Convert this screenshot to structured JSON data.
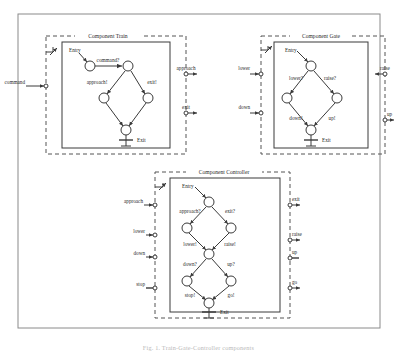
{
  "figure": {
    "caption": "Fig. 1.  Train-Gate-Controller components",
    "outer_border_color": "#7b7b7b",
    "dashed_color": "#555555",
    "solid_color": "#3a3a3a"
  },
  "components": [
    {
      "id": "train",
      "title": "Component Train",
      "entry_label": "Entry",
      "exit_label": "Exit",
      "transitions": [
        {
          "id": "t-command",
          "label": "command?"
        },
        {
          "id": "t-approach",
          "label": "approach!"
        },
        {
          "id": "t-exit",
          "label": "exit!"
        }
      ],
      "ports_left": [
        {
          "id": "p-command",
          "label": "command",
          "direction": "in"
        }
      ],
      "ports_right": [
        {
          "id": "p-approach",
          "label": "approach",
          "direction": "out"
        },
        {
          "id": "p-exit",
          "label": "exit",
          "direction": "out"
        }
      ]
    },
    {
      "id": "gate",
      "title": "Component Gate",
      "entry_label": "Entry",
      "exit_label": "Exit",
      "transitions": [
        {
          "id": "g-lower",
          "label": "lower?"
        },
        {
          "id": "g-raise",
          "label": "raise?"
        },
        {
          "id": "g-down",
          "label": "down!"
        },
        {
          "id": "g-up",
          "label": "up!"
        }
      ],
      "ports_left": [
        {
          "id": "p-lower",
          "label": "lower",
          "direction": "in"
        },
        {
          "id": "p-down",
          "label": "down",
          "direction": "in"
        }
      ],
      "ports_right": [
        {
          "id": "p-raise",
          "label": "raise",
          "direction": "out"
        },
        {
          "id": "p-up",
          "label": "up",
          "direction": "out"
        }
      ]
    },
    {
      "id": "controller",
      "title": "Component Controller",
      "entry_label": "Entry",
      "exit_label": "Exit",
      "transitions": [
        {
          "id": "c-approach",
          "label": "approach?"
        },
        {
          "id": "c-exit",
          "label": "exit?"
        },
        {
          "id": "c-lower",
          "label": "lower!"
        },
        {
          "id": "c-raise",
          "label": "raise!"
        },
        {
          "id": "c-down",
          "label": "down?"
        },
        {
          "id": "c-up",
          "label": "up?"
        },
        {
          "id": "c-stop",
          "label": "stop!"
        },
        {
          "id": "c-go",
          "label": "go!"
        }
      ],
      "ports_left": [
        {
          "id": "p-c-approach",
          "label": "approach",
          "direction": "in"
        },
        {
          "id": "p-c-lower",
          "label": "lower",
          "direction": "in"
        },
        {
          "id": "p-c-down",
          "label": "down",
          "direction": "in"
        },
        {
          "id": "p-c-stop",
          "label": "stop",
          "direction": "in"
        }
      ],
      "ports_right": [
        {
          "id": "p-c-exit",
          "label": "exit",
          "direction": "out"
        },
        {
          "id": "p-c-raise",
          "label": "raise",
          "direction": "out"
        },
        {
          "id": "p-c-up",
          "label": "up",
          "direction": "out"
        },
        {
          "id": "p-c-go",
          "label": "go",
          "direction": "out"
        }
      ]
    }
  ]
}
